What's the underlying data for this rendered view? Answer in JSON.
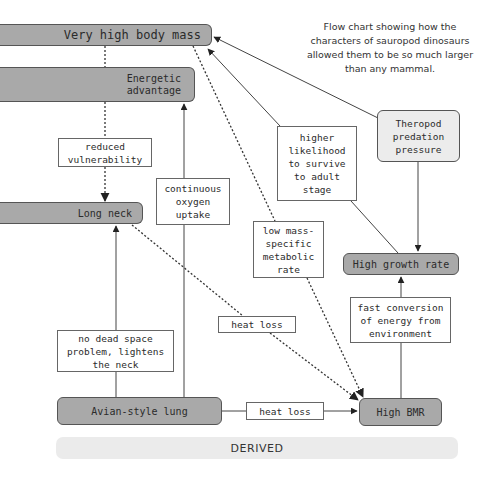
{
  "caption": "Flow chart showing how the characters of sauropod dinosaurs allowed them to be so much larger than any mammal.",
  "nodes": {
    "very_high_body_mass": "Very high body mass",
    "energetic_advantage": "Energetic advantage",
    "long_neck": "Long neck",
    "theropod_predation": "Theropod predation pressure",
    "high_growth_rate": "High growth rate",
    "avian_lung": "Avian-style lung",
    "high_bmr": "High BMR"
  },
  "edge_labels": {
    "reduced_vulnerability": "reduced vulnerability",
    "continuous_oxygen": "continuous oxygen uptake",
    "higher_likelihood": "higher likelihood to survive to adult stage",
    "low_metabolic": "low mass-specific metabolic rate",
    "fast_conversion": "fast conversion of energy from environment",
    "heat_loss_upper": "heat loss",
    "no_dead_space": "no dead space problem, lightens the neck",
    "heat_loss_lower": "heat loss"
  },
  "footer": {
    "derived_label": "DERIVED"
  },
  "colors": {
    "dark_node": "#a9a9a9",
    "light_node": "#ececec",
    "derived_bar": "#ebebeb",
    "line": "#444444"
  }
}
